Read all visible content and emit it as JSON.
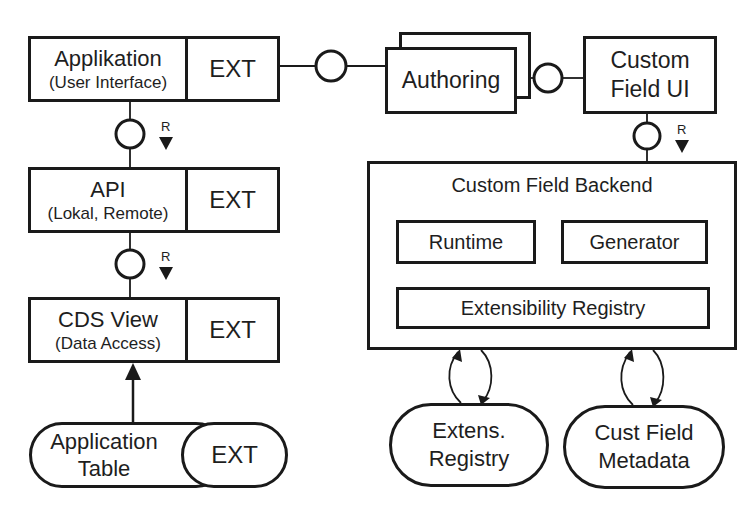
{
  "diagram": {
    "applikation": {
      "title": "Applikation",
      "subtitle": "(User Interface)",
      "ext": "EXT"
    },
    "api": {
      "title": "API",
      "subtitle": "(Lokal, Remote)",
      "ext": "EXT"
    },
    "cds_view": {
      "title": "CDS View",
      "subtitle": "(Data Access)",
      "ext": "EXT"
    },
    "application_table": {
      "line1": "Application",
      "line2": "Table",
      "ext": "EXT"
    },
    "authoring": {
      "title": "Authoring"
    },
    "custom_field_ui": {
      "line1": "Custom",
      "line2": "Field UI"
    },
    "custom_field_backend": {
      "title": "Custom Field Backend",
      "runtime": "Runtime",
      "generator": "Generator",
      "extensibility_registry": "Extensibility Registry"
    },
    "extens_registry_store": {
      "line1": "Extens.",
      "line2": "Registry"
    },
    "cust_field_metadata_store": {
      "line1": "Cust Field",
      "line2": "Metadata"
    },
    "request_labels": {
      "r1": "R",
      "r2": "R",
      "r3": "R"
    },
    "colors": {
      "stroke": "#1a1a1a",
      "background": "#ffffff",
      "text": "#1e1e1e"
    }
  }
}
